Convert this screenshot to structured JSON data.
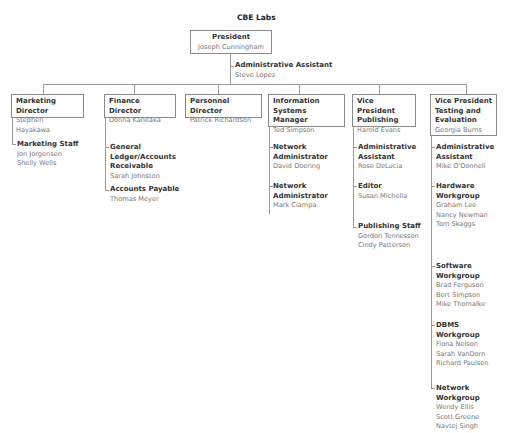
{
  "org": {
    "title": "CBE Labs",
    "president": {
      "role": "President",
      "name": "Joseph Cunningham"
    },
    "president_assistant": {
      "role": "Administrative Assistant",
      "name": "Steve Lopez"
    },
    "departments": [
      {
        "role": "Marketing Director",
        "name": "Stephen Hayakawa",
        "subs": [
          {
            "role": "Marketing Staff",
            "names": [
              "Jon Jorgensen",
              "Shelly Wells"
            ]
          }
        ]
      },
      {
        "role": "Finance Director",
        "name": "Donna Kaneaka",
        "subs": [
          {
            "role": "General Ledger/Accounts Receivable",
            "names": [
              "Sarah Johnston"
            ]
          },
          {
            "role": "Accounts Payable",
            "names": [
              "Thomas Meyer"
            ]
          }
        ]
      },
      {
        "role": "Personnel Director",
        "name": "Patrick Richardson",
        "subs": []
      },
      {
        "role": "Information Systems Manager",
        "name": "Ted Simpson",
        "subs": [
          {
            "role": "Network Administrator",
            "names": [
              "David Doering"
            ]
          },
          {
            "role": "Network Administrator",
            "names": [
              "Mark Ciampa"
            ]
          }
        ]
      },
      {
        "role": "Vice President Publishing",
        "name": "Harold Evans",
        "subs": [
          {
            "role": "Administrative Assistant",
            "names": [
              "Rose DeLucia"
            ]
          },
          {
            "role": "Editor",
            "names": [
              "Susan Michella"
            ]
          },
          {
            "role": "Publishing Staff",
            "names": [
              "Gordon Tennesson",
              "Cindy Patterson"
            ]
          }
        ]
      },
      {
        "role": "Vice President Testing and Evaluation",
        "name": "Georgia Burns",
        "subs": [
          {
            "role": "Administrative Assistant",
            "names": [
              "Mike O'Donnell"
            ]
          },
          {
            "role": "Hardware Workgroup",
            "names": [
              "Graham Lee",
              "Nancy Newman",
              "Tom Skaggs"
            ]
          },
          {
            "role": "Software Workgroup",
            "names": [
              "Brad Ferguson",
              "Bert Simpson",
              "Mike Thomalke"
            ]
          },
          {
            "role": "DBMS Workgroup",
            "names": [
              "Fiona Nelson",
              "Sarah VanDorn",
              "Richard Paulsen"
            ]
          },
          {
            "role": "Network Workgroup",
            "names": [
              "Wendy Ellis",
              "Scott Greene",
              "Navtej Singh"
            ]
          }
        ]
      }
    ]
  },
  "colors": {
    "line": "#9a9a9a",
    "box_border": "#8a8a8a",
    "role_text": "#333333",
    "name_text": "#777777"
  }
}
